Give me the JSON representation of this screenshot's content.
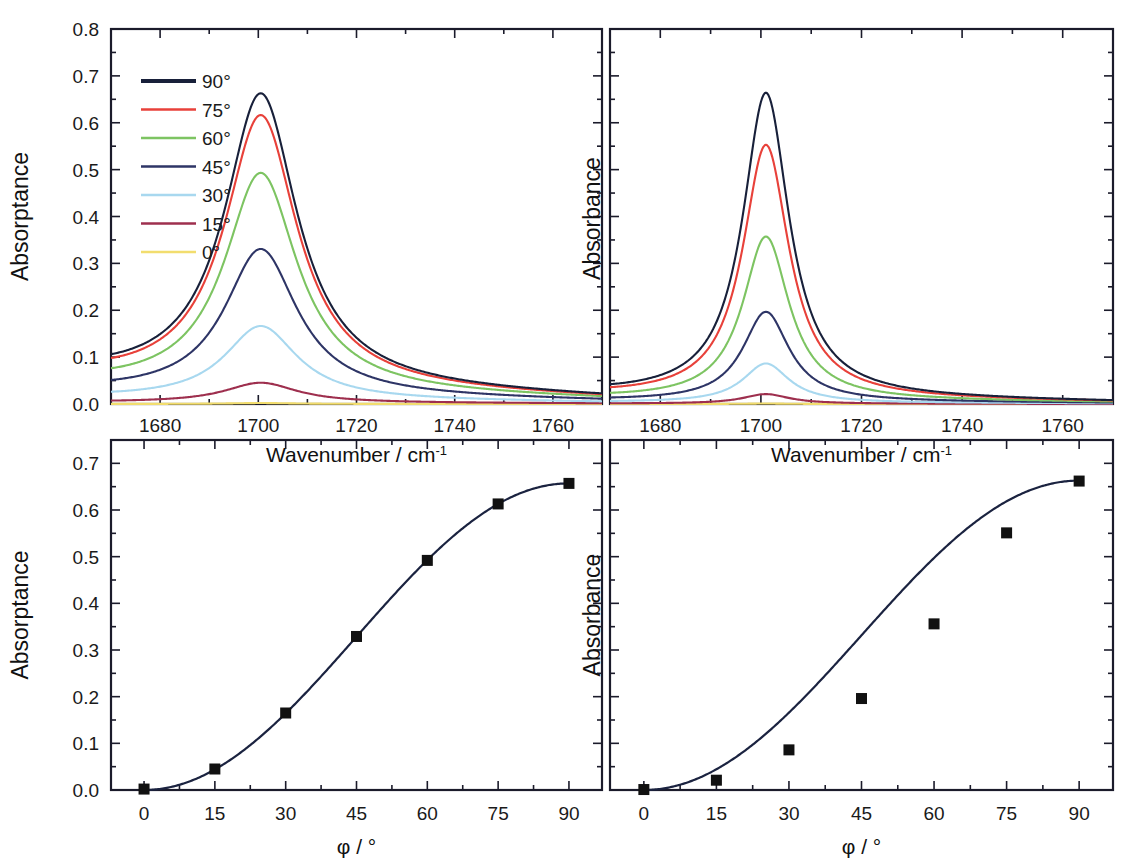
{
  "figure": {
    "background": "#ffffff",
    "frame_color": "#1b1b2b",
    "panel_count": 4
  },
  "axis_titles": {
    "wavenumber": "Wavenumber / cm",
    "wavenumber_sup": "-1",
    "phi": "φ / °",
    "absorptance": "Absorptance",
    "absorbance": "Absorbance"
  },
  "legend": {
    "position": "top-left of panel A",
    "entries": [
      {
        "label": "90°",
        "color": "#18203a"
      },
      {
        "label": "75°",
        "color": "#e8413a"
      },
      {
        "label": "60°",
        "color": "#7dc462"
      },
      {
        "label": "45°",
        "color": "#2e3566"
      },
      {
        "label": "30°",
        "color": "#a8d8ef"
      },
      {
        "label": "15°",
        "color": "#9e2f4e"
      },
      {
        "label": "0°",
        "color": "#f2dd6e"
      }
    ]
  },
  "chart_data": [
    {
      "id": "panel-a",
      "type": "line",
      "title": "",
      "xlabel": "Wavenumber / cm-1",
      "ylabel": "Absorptance",
      "xlim": [
        1670,
        1770
      ],
      "ylim": [
        0.0,
        0.8
      ],
      "xticks": [
        1680,
        1700,
        1720,
        1740,
        1760
      ],
      "yticks": [
        "0.0",
        "0.1",
        "0.2",
        "0.3",
        "0.4",
        "0.5",
        "0.6",
        "0.7",
        "0.8"
      ],
      "minor_ticks": true,
      "grid": false,
      "peak_center": 1700.5,
      "peak_width_hwhm": 9.0,
      "series": [
        {
          "name": "90°",
          "color": "#18203a",
          "peak": 0.657,
          "baseline_left": 0.058,
          "baseline_right": 0.012
        },
        {
          "name": "75°",
          "color": "#e8413a",
          "peak": 0.611,
          "baseline_left": 0.053,
          "baseline_right": 0.011
        },
        {
          "name": "60°",
          "color": "#7dc462",
          "peak": 0.489,
          "baseline_left": 0.04,
          "baseline_right": 0.009
        },
        {
          "name": "45°",
          "color": "#2e3566",
          "peak": 0.328,
          "baseline_left": 0.027,
          "baseline_right": 0.006
        },
        {
          "name": "30°",
          "color": "#a8d8ef",
          "peak": 0.165,
          "baseline_left": 0.014,
          "baseline_right": 0.003
        },
        {
          "name": "15°",
          "color": "#9e2f4e",
          "peak": 0.045,
          "baseline_left": 0.004,
          "baseline_right": 0.001
        },
        {
          "name": "0°",
          "color": "#f2dd6e",
          "peak": 0.002,
          "baseline_left": 0.0,
          "baseline_right": 0.0
        }
      ]
    },
    {
      "id": "panel-b",
      "type": "line",
      "title": "",
      "xlabel": "Wavenumber / cm-1",
      "ylabel": "Absorbance",
      "xlim": [
        1670,
        1770
      ],
      "ylim": [
        0.0,
        0.8
      ],
      "xticks": [
        1680,
        1700,
        1720,
        1740,
        1760
      ],
      "yticks": [
        "0.0",
        "0.1",
        "0.2",
        "0.3",
        "0.4",
        "0.5",
        "0.6",
        "0.7",
        "0.8"
      ],
      "minor_ticks": true,
      "grid": false,
      "peak_center": 1701.0,
      "peak_width_hwhm": 5.6,
      "series": [
        {
          "name": "90°",
          "color": "#18203a",
          "peak": 0.662,
          "baseline_left": 0.022,
          "baseline_right": 0.004
        },
        {
          "name": "75°",
          "color": "#e8413a",
          "peak": 0.551,
          "baseline_left": 0.019,
          "baseline_right": 0.004
        },
        {
          "name": "60°",
          "color": "#7dc462",
          "peak": 0.356,
          "baseline_left": 0.013,
          "baseline_right": 0.003
        },
        {
          "name": "45°",
          "color": "#2e3566",
          "peak": 0.196,
          "baseline_left": 0.008,
          "baseline_right": 0.002
        },
        {
          "name": "30°",
          "color": "#a8d8ef",
          "peak": 0.086,
          "baseline_left": 0.004,
          "baseline_right": 0.001
        },
        {
          "name": "15°",
          "color": "#9e2f4e",
          "peak": 0.021,
          "baseline_left": 0.001,
          "baseline_right": 0.0
        },
        {
          "name": "0°",
          "color": "#f2dd6e",
          "peak": 0.001,
          "baseline_left": 0.0,
          "baseline_right": 0.0
        }
      ]
    },
    {
      "id": "panel-c",
      "type": "scatter",
      "title": "",
      "xlabel": "φ / °",
      "ylabel": "Absorptance",
      "xlim": [
        -7,
        97
      ],
      "ylim": [
        0.0,
        0.75
      ],
      "xticks": [
        0,
        15,
        30,
        45,
        60,
        75,
        90
      ],
      "yticks": [
        "0.0",
        "0.1",
        "0.2",
        "0.3",
        "0.4",
        "0.5",
        "0.6",
        "0.7"
      ],
      "minor_ticks": true,
      "grid": false,
      "marker": "filled-square",
      "marker_color": "#111111",
      "line_color": "#1b2340",
      "x": [
        0,
        15,
        30,
        45,
        60,
        75,
        90
      ],
      "values": [
        0.002,
        0.045,
        0.165,
        0.329,
        0.492,
        0.613,
        0.657
      ],
      "fit_curve": {
        "name": "sin^2 fit",
        "amplitude": 0.657,
        "matches_points": true
      }
    },
    {
      "id": "panel-d",
      "type": "scatter",
      "title": "",
      "xlabel": "φ / °",
      "ylabel": "Absorbance",
      "xlim": [
        -7,
        97
      ],
      "ylim": [
        0.0,
        0.75
      ],
      "xticks": [
        0,
        15,
        30,
        45,
        60,
        75,
        90
      ],
      "yticks": [
        "0.0",
        "0.1",
        "0.2",
        "0.3",
        "0.4",
        "0.5",
        "0.6",
        "0.7"
      ],
      "minor_ticks": true,
      "grid": false,
      "marker": "filled-square",
      "marker_color": "#111111",
      "line_color": "#1b2340",
      "x": [
        0,
        15,
        30,
        45,
        60,
        75,
        90
      ],
      "values": [
        0.001,
        0.021,
        0.086,
        0.196,
        0.356,
        0.551,
        0.662
      ],
      "fit_curve": {
        "name": "sin^2 fit",
        "amplitude": 0.663,
        "matches_points": false
      }
    }
  ]
}
